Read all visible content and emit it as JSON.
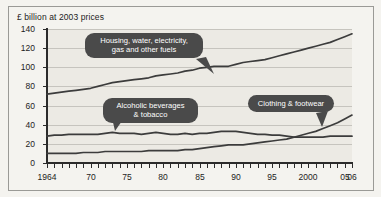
{
  "figure": {
    "background_color": "#f4f3ef",
    "plot_background_color": "#eceae4",
    "border_color": "#9a9a96",
    "line_color": "#3c3c3c",
    "callout_color": "#4a4a4a",
    "gridline_color": "#c6c4be"
  },
  "chart_data": {
    "type": "line",
    "title": "",
    "subtitle": "",
    "xlabel": "",
    "ylabel": "£ billion at 2003 prices",
    "axis_title": "£ billion at 2003 prices",
    "xlim": [
      1964,
      2006
    ],
    "ylim": [
      0,
      140
    ],
    "ytick_values": [
      0,
      20,
      40,
      60,
      80,
      100,
      120,
      140
    ],
    "ytick_labels": [
      "0",
      "20",
      "40",
      "60",
      "80",
      "100",
      "120",
      "140"
    ],
    "xtick_values": [
      1964,
      1965,
      1966,
      1967,
      1968,
      1969,
      1970,
      1971,
      1972,
      1973,
      1974,
      1975,
      1976,
      1977,
      1978,
      1979,
      1980,
      1981,
      1982,
      1983,
      1984,
      1985,
      1986,
      1987,
      1988,
      1989,
      1990,
      1991,
      1992,
      1993,
      1994,
      1995,
      1996,
      1997,
      1998,
      1999,
      2000,
      2001,
      2002,
      2003,
      2004,
      2005,
      2006
    ],
    "xtick_labels": [
      {
        "value": 1964,
        "label": "1964"
      },
      {
        "value": 1970,
        "label": "70"
      },
      {
        "value": 1975,
        "label": "75"
      },
      {
        "value": 1980,
        "label": "80"
      },
      {
        "value": 1985,
        "label": "85"
      },
      {
        "value": 1990,
        "label": "90"
      },
      {
        "value": 1995,
        "label": "95"
      },
      {
        "value": 2000,
        "label": "2000"
      },
      {
        "value": 2005,
        "label": "05"
      },
      {
        "value": 2006,
        "label": "06"
      }
    ],
    "grid": "horizontal",
    "legend": "callout-annotations",
    "legend_position": "inline",
    "x": [
      1964,
      1965,
      1966,
      1967,
      1968,
      1969,
      1970,
      1971,
      1972,
      1973,
      1974,
      1975,
      1976,
      1977,
      1978,
      1979,
      1980,
      1981,
      1982,
      1983,
      1984,
      1985,
      1986,
      1987,
      1988,
      1989,
      1990,
      1991,
      1992,
      1993,
      1994,
      1995,
      1996,
      1997,
      1998,
      1999,
      2000,
      2001,
      2002,
      2003,
      2004,
      2005,
      2006
    ],
    "series": [
      {
        "name": "Housing, water, electricity, gas and other fuels",
        "values": [
          72,
          73,
          74,
          75,
          76,
          77,
          78,
          80,
          82,
          84,
          85,
          86,
          87,
          88,
          89,
          91,
          92,
          93,
          94,
          96,
          97,
          99,
          100,
          101,
          101,
          101,
          103,
          105,
          106,
          107,
          108,
          110,
          112,
          114,
          116,
          118,
          120,
          122,
          124,
          126,
          129,
          132,
          135
        ]
      },
      {
        "name": "Alcoholic beverages & tobacco",
        "values": [
          28,
          29,
          29,
          30,
          30,
          30,
          30,
          30,
          31,
          32,
          31,
          31,
          31,
          30,
          31,
          32,
          31,
          30,
          30,
          31,
          30,
          31,
          31,
          32,
          33,
          33,
          33,
          32,
          31,
          30,
          30,
          29,
          29,
          28,
          27,
          27,
          27,
          27,
          27,
          28,
          28,
          28,
          28
        ]
      },
      {
        "name": "Clothing & footwear",
        "values": [
          10,
          10,
          10,
          10,
          10,
          11,
          11,
          11,
          12,
          12,
          12,
          12,
          12,
          12,
          13,
          13,
          13,
          13,
          13,
          14,
          14,
          15,
          16,
          17,
          18,
          19,
          19,
          19,
          20,
          21,
          22,
          23,
          24,
          25,
          27,
          29,
          31,
          33,
          36,
          39,
          42,
          46,
          50
        ]
      }
    ],
    "annotations": [
      {
        "name": "housing-callout",
        "text": "Housing, water, electricity,\ngas and other fuels",
        "target_series": "Housing, water, electricity, gas and other fuels"
      },
      {
        "name": "alcohol-callout",
        "text": "Alcoholic beverages\n& tobacco",
        "target_series": "Alcoholic beverages & tobacco"
      },
      {
        "name": "clothing-callout",
        "text": "Clothing & footwear",
        "target_series": "Clothing & footwear"
      }
    ]
  }
}
